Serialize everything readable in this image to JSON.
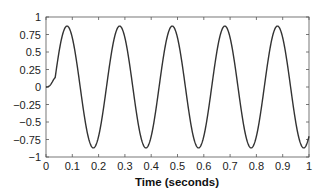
{
  "chart_data": {
    "type": "line",
    "title": "",
    "xlabel": "Time (seconds)",
    "ylabel": "",
    "xlim": [
      0,
      1
    ],
    "ylim": [
      -1,
      1
    ],
    "grid": false,
    "legend": null,
    "x_ticks": [
      "0",
      "0.1",
      "0.2",
      "0.3",
      "0.4",
      "0.5",
      "0.6",
      "0.7",
      "0.8",
      "0.9",
      "1"
    ],
    "y_ticks": [
      "1",
      "0.75",
      "0.5",
      "0.25",
      "0",
      "−0.25",
      "−0.5",
      "−0.75",
      "−1"
    ],
    "series": [
      {
        "name": "signal",
        "color": "#333333",
        "description": "sinusoid ~5 Hz, amplitude ~0.87, starts near 0 with ramp-in",
        "x": [
          0,
          0.01,
          0.02,
          0.03,
          0.04,
          0.05,
          0.06,
          0.07,
          0.08,
          0.09,
          0.1,
          0.11,
          0.12,
          0.13,
          0.14,
          0.15,
          0.16,
          0.17,
          0.18,
          0.19,
          0.2,
          0.28,
          0.38,
          0.48,
          0.58,
          0.68,
          0.78,
          0.88,
          0.98,
          1.0
        ],
        "y": [
          0,
          0.03,
          0.15,
          0.43,
          0.66,
          0.81,
          0.87,
          0.87,
          0.87,
          0.81,
          0.66,
          0.43,
          0.15,
          -0.15,
          -0.43,
          -0.66,
          -0.81,
          -0.87,
          -0.87,
          -0.81,
          -0.66,
          0.87,
          -0.87,
          0.87,
          -0.87,
          0.87,
          -0.87,
          0.87,
          -0.87,
          -0.7
        ]
      }
    ]
  }
}
